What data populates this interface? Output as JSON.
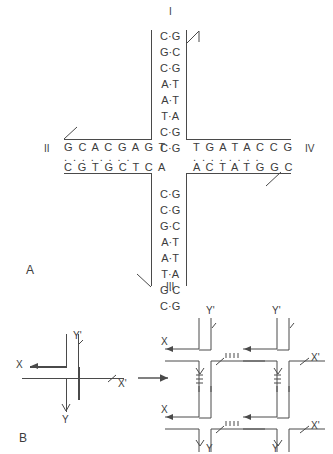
{
  "figure": {
    "panels": [
      {
        "id": "A",
        "label": "A"
      },
      {
        "id": "B",
        "label": "B"
      }
    ]
  },
  "panel_a": {
    "title_label": "A",
    "arm_labels": {
      "top": "I",
      "left": "II",
      "bottom": "III",
      "right": "IV"
    },
    "arms": {
      "top": {
        "name": "arm-I",
        "orientation": "vertical",
        "base_pairs": [
          {
            "left": "C",
            "right": "G"
          },
          {
            "left": "G",
            "right": "C"
          },
          {
            "left": "C",
            "right": "G"
          },
          {
            "left": "A",
            "right": "T"
          },
          {
            "left": "A",
            "right": "T"
          },
          {
            "left": "T",
            "right": "A"
          },
          {
            "left": "C",
            "right": "G"
          },
          {
            "left": "C",
            "right": "G"
          }
        ]
      },
      "bottom": {
        "name": "arm-III",
        "orientation": "vertical",
        "base_pairs": [
          {
            "left": "C",
            "right": "G"
          },
          {
            "left": "C",
            "right": "G"
          },
          {
            "left": "G",
            "right": "C"
          },
          {
            "left": "A",
            "right": "T"
          },
          {
            "left": "A",
            "right": "T"
          },
          {
            "left": "T",
            "right": "A"
          },
          {
            "left": "G",
            "right": "C"
          },
          {
            "left": "C",
            "right": "G"
          }
        ]
      },
      "left": {
        "name": "arm-II",
        "orientation": "horizontal",
        "top_strand": "G C A C G A G T",
        "dots": ". . . . . . . .",
        "bottom_strand": "C G T G C T C A"
      },
      "right": {
        "name": "arm-IV",
        "orientation": "horizontal",
        "top_strand": "T G A T A C C G",
        "dots": ". . . . . . . .",
        "bottom_strand": "A C T A T G G C"
      }
    }
  },
  "panel_b": {
    "title_label": "B",
    "monomer": {
      "name": "single-junction",
      "labels": {
        "left": "X",
        "top": "Y'",
        "right": "X'",
        "bottom": "Y"
      }
    },
    "arrow_between": "→",
    "lattice": {
      "name": "junction-lattice",
      "top_labels": [
        "Y'",
        "Y'"
      ],
      "bottom_labels": [
        "Y",
        "Y"
      ],
      "left_labels": [
        "X",
        "X"
      ],
      "right_labels": [
        "X'",
        "X'"
      ],
      "rows": 2,
      "cols": 2
    }
  },
  "colors": {
    "stroke": "#4a4a4a",
    "text": "#3c3c3c",
    "background": "#ffffff"
  }
}
